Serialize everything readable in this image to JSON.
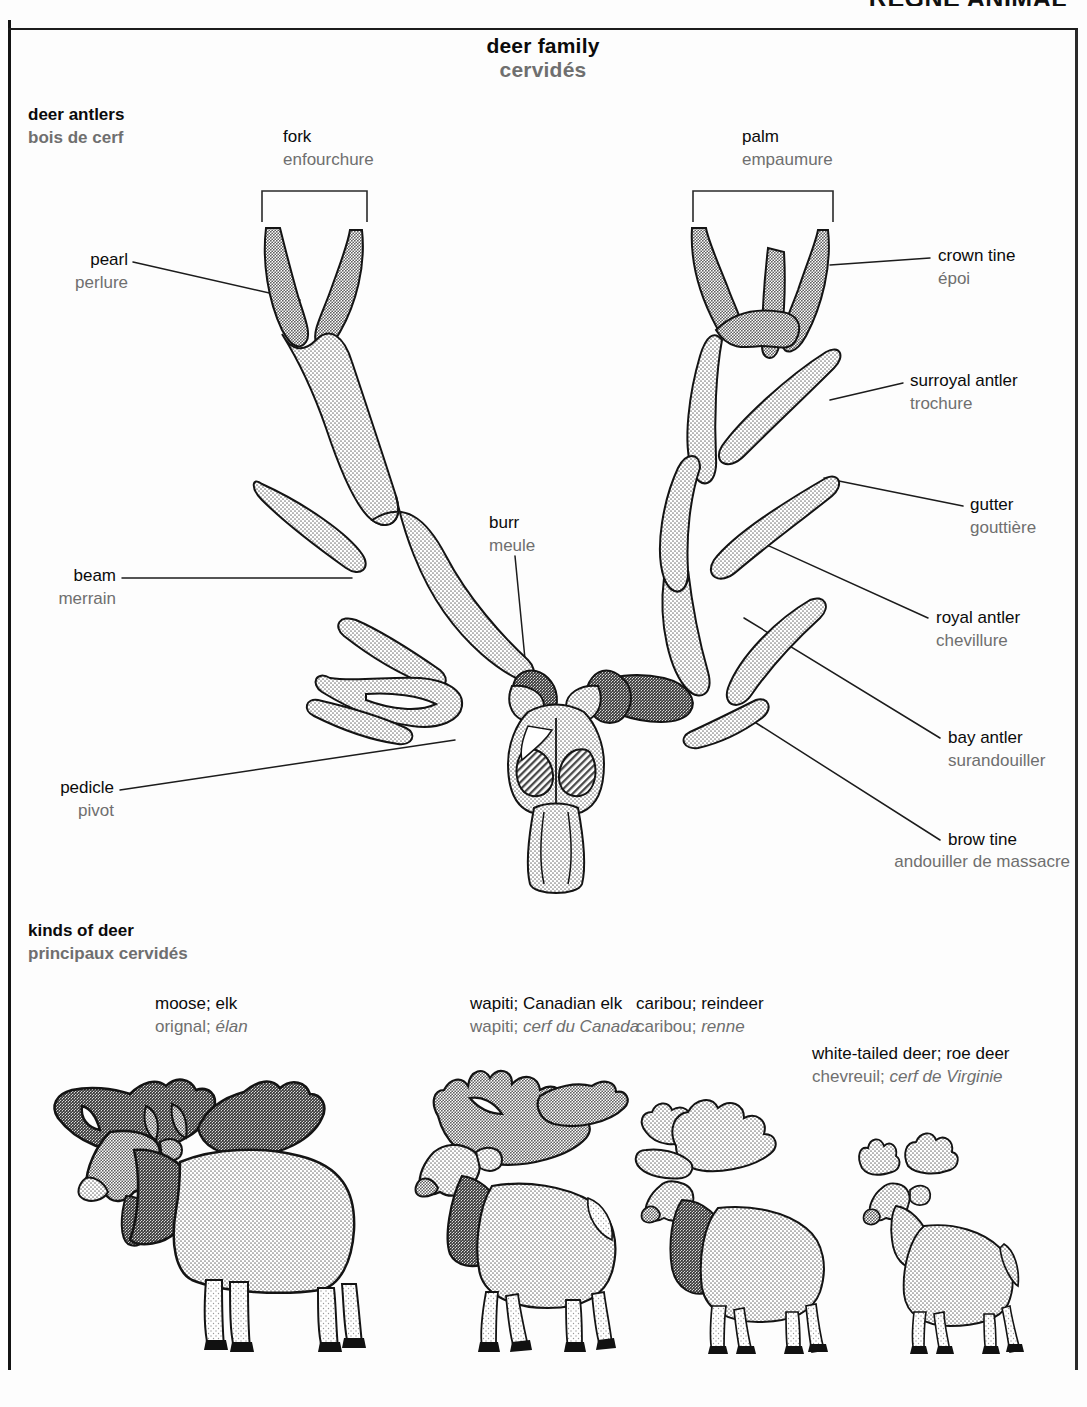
{
  "running_head": "RÈGNE ANIMAL",
  "title": {
    "en": "deer family",
    "fr": "cervidés"
  },
  "sections": {
    "antlers": {
      "en": "deer antlers",
      "fr": "bois de cerf"
    },
    "kinds": {
      "en": "kinds of deer",
      "fr": "principaux cervidés"
    }
  },
  "antler_labels": [
    {
      "key": "fork",
      "en": "fork",
      "fr": "enfourchure"
    },
    {
      "key": "palm",
      "en": "palm",
      "fr": "empaumure"
    },
    {
      "key": "pearl",
      "en": "pearl",
      "fr": "perlure"
    },
    {
      "key": "crown-tine",
      "en": "crown tine",
      "fr": "époi"
    },
    {
      "key": "surroyal",
      "en": "surroyal antler",
      "fr": "trochure"
    },
    {
      "key": "gutter",
      "en": "gutter",
      "fr": "gouttière"
    },
    {
      "key": "beam",
      "en": "beam",
      "fr": "merrain"
    },
    {
      "key": "burr",
      "en": "burr",
      "fr": "meule"
    },
    {
      "key": "royal",
      "en": "royal antler",
      "fr": "chevillure"
    },
    {
      "key": "bay",
      "en": "bay antler",
      "fr": "surandouiller"
    },
    {
      "key": "pedicle",
      "en": "pedicle",
      "fr": "pivot"
    },
    {
      "key": "brow-tine",
      "en": "brow tine",
      "fr": "andouiller de massacre"
    }
  ],
  "species": [
    {
      "key": "moose",
      "en": "moose; elk",
      "fr_plain": "orignal; ",
      "fr_italic": "élan"
    },
    {
      "key": "wapiti",
      "en": "wapiti; Canadian elk",
      "fr_plain": "wapiti; ",
      "fr_italic": "cerf du Canada"
    },
    {
      "key": "caribou",
      "en": "caribou; reindeer",
      "fr_plain": "caribou; ",
      "fr_italic": "renne"
    },
    {
      "key": "whitetailed",
      "en": "white-tailed deer; roe deer",
      "fr_plain": "chevreuil; ",
      "fr_italic": "cerf de Virginie"
    }
  ],
  "colors": {
    "ink": "#0b0b0b",
    "french": "#6f6f6f",
    "leader": "#1c1c1c",
    "fill_light": "#d6d6d6",
    "fill_mid": "#b5b5b5",
    "fill_dark": "#8c8c8c",
    "paper": "#fdfdfd"
  }
}
